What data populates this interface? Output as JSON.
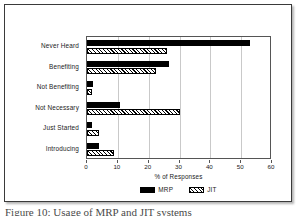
{
  "figure": {
    "caption": "Figure 10: Usage of MRP and JIT systems"
  },
  "chart_data": {
    "type": "bar",
    "orientation": "horizontal",
    "title": "",
    "xlabel": "% of Responses",
    "ylabel": "",
    "xlim": [
      0,
      60
    ],
    "xticks": [
      0,
      10,
      20,
      30,
      40,
      50,
      60
    ],
    "grid": true,
    "legend_position": "bottom-center",
    "categories": [
      "Never Heard",
      "Benefiting",
      "Not Benefiting",
      "Not Necessary",
      "Just Started",
      "Introducing"
    ],
    "series": [
      {
        "name": "MRP",
        "color": "#000000",
        "fill": "solid",
        "values": [
          53,
          26.5,
          2,
          10.7,
          1.5,
          3.8
        ]
      },
      {
        "name": "JIT",
        "color": "#000000",
        "fill": "hatched",
        "values": [
          26,
          22.5,
          1.5,
          30,
          4,
          8.7
        ]
      }
    ]
  }
}
